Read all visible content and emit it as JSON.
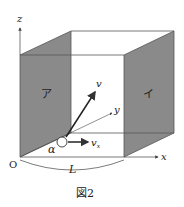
{
  "figure": {
    "caption": "図2",
    "colors": {
      "wall": "#8a8a8a",
      "wall_edge": "#555555",
      "line": "#333333",
      "background": "#ffffff"
    }
  },
  "axes": {
    "origin_label": "O",
    "x_label": "x",
    "y_label": "y",
    "z_label": "z"
  },
  "walls": {
    "left_label": "ア",
    "right_label": "イ"
  },
  "particle": {
    "label": "α",
    "velocity_label": "v",
    "velocity_x_label": "v",
    "velocity_x_subscript": "x"
  },
  "dimension": {
    "length_label": "L"
  }
}
